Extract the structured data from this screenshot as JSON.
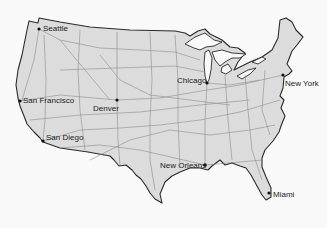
{
  "map": {
    "title": "United States interstate highway map",
    "colors": {
      "background": "#f9f9f9",
      "land": "#dcdcdc",
      "outline": "#2a2a2a",
      "roads": "#8c8c8c",
      "water": "#f9f9f9",
      "city_dot": "#111111",
      "label": "#222222"
    },
    "cities": [
      {
        "name": "Seattle",
        "dot": [
          39,
          29
        ],
        "label": [
          43,
          25
        ]
      },
      {
        "name": "San Francisco",
        "dot": [
          20,
          101
        ],
        "label": [
          23,
          97
        ]
      },
      {
        "name": "Denver",
        "dot": [
          117,
          100
        ],
        "label": [
          93,
          105
        ]
      },
      {
        "name": "San Diego",
        "dot": [
          43,
          141
        ],
        "label": [
          46,
          134
        ]
      },
      {
        "name": "Chicago",
        "dot": [
          207,
          83
        ],
        "label": [
          177,
          77
        ]
      },
      {
        "name": "New York",
        "dot": [
          283,
          75
        ],
        "label": [
          285,
          80
        ]
      },
      {
        "name": "New Orleans",
        "dot": [
          205,
          165
        ],
        "label": [
          160,
          162
        ]
      },
      {
        "name": "Miami",
        "dot": [
          269,
          193
        ],
        "label": [
          273,
          191
        ]
      }
    ]
  }
}
